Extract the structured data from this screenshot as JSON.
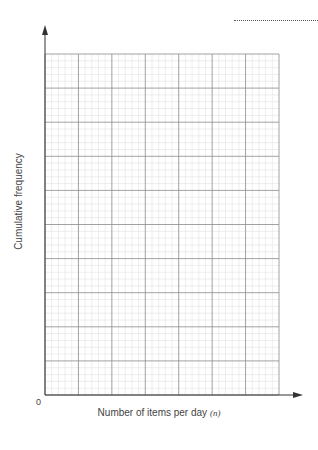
{
  "chart_data": {
    "type": "line",
    "title": "",
    "xlabel": "Number of items per day",
    "xlabel_var": "(n)",
    "ylabel": "Cumulative frequency",
    "origin_label": "0",
    "series": [],
    "grid": {
      "major_cols": 7,
      "major_rows": 10,
      "minor_per_major": 5
    },
    "note": "Blank cumulative frequency grid with no plotted data"
  },
  "answer_line": ""
}
